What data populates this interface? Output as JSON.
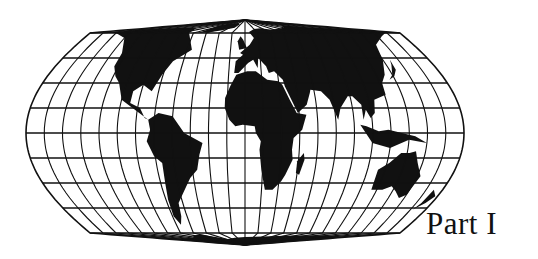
{
  "page": {
    "label": "Part I"
  },
  "map": {
    "projection": "sinusoidal-like world map",
    "graticule_spacing_deg": 15,
    "colors": {
      "ink": "#111111",
      "background": "#ffffff"
    },
    "geometry": {
      "center_x": 245,
      "equator_y": 133,
      "half_width": 219,
      "north_pole_y": 20,
      "south_pole_y": 245,
      "parallel_spacing_px": 25
    },
    "continents": [
      "North America",
      "South America",
      "Greenland",
      "Europe",
      "Asia",
      "Africa",
      "Madagascar",
      "Australia",
      "Antarctica",
      "New Zealand"
    ]
  }
}
